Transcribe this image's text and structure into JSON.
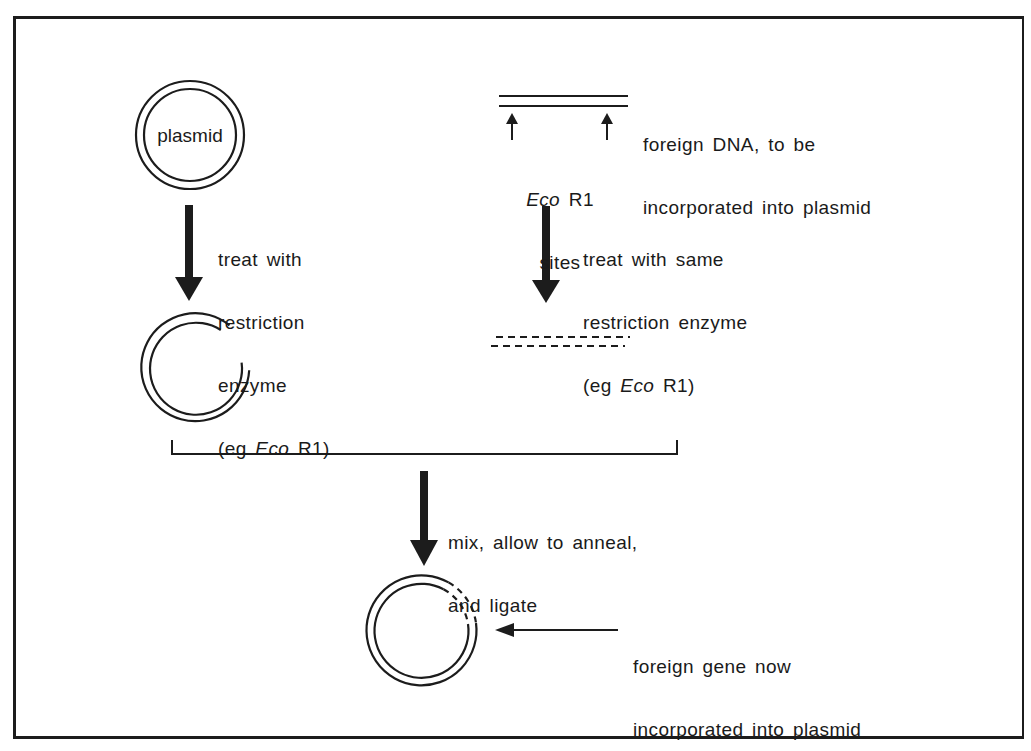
{
  "figure": {
    "stroke_color": "#1c1c1c",
    "background": "#ffffff"
  },
  "plasmid": {
    "label": "plasmid"
  },
  "foreign_dna": {
    "caption_line1": "foreign DNA, to be",
    "caption_line2": "incorporated into plasmid",
    "sites_italic": "Eco",
    "sites_rest": " R1",
    "sites_line2": "sites"
  },
  "step_left": {
    "line1": "treat with",
    "line2": "restriction",
    "line3": "enzyme",
    "line4_prefix": "(eg ",
    "line4_italic": "Eco",
    "line4_suffix": " R1)"
  },
  "step_right": {
    "line1": "treat with same",
    "line2": "restriction enzyme",
    "line3_prefix": "(eg ",
    "line3_italic": "Eco",
    "line3_suffix": " R1)"
  },
  "step_mix": {
    "line1": "mix, allow to anneal,",
    "line2": "and ligate"
  },
  "result": {
    "line1": "foreign gene now",
    "line2": "incorporated into plasmid"
  }
}
